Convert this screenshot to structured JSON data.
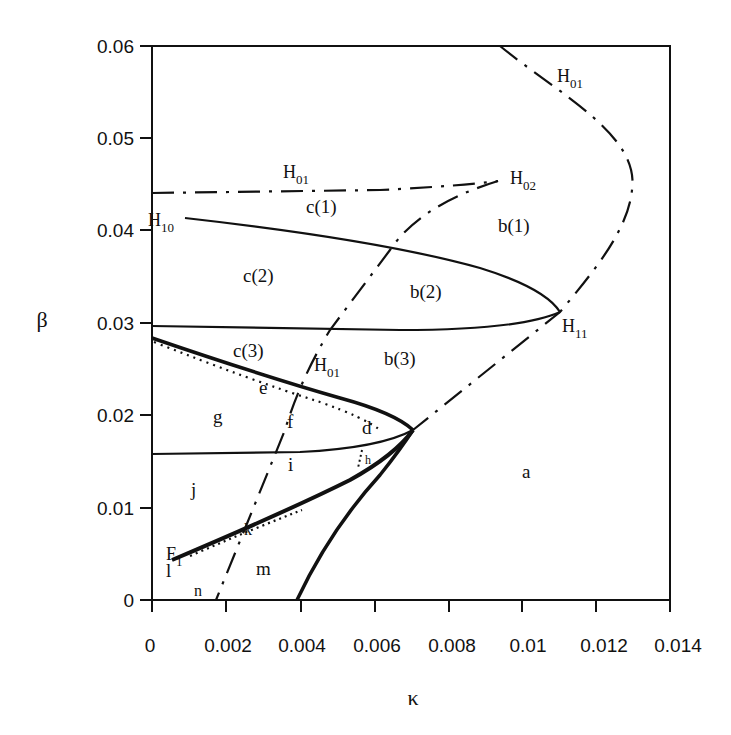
{
  "figure": {
    "x_axis": {
      "label": "κ",
      "ticks": [
        "0",
        "0.002",
        "0.004",
        "0.006",
        "0.008",
        "0.01",
        "0.012",
        "0.014"
      ],
      "range": [
        0,
        0.014
      ]
    },
    "y_axis": {
      "label": "β",
      "ticks": [
        "0",
        "0.01",
        "0.02",
        "0.03",
        "0.04",
        "0.05",
        "0.06"
      ],
      "range": [
        0,
        0.06
      ]
    },
    "curve_labels": [
      {
        "id": "H01_top_right",
        "main": "H",
        "sub": "01"
      },
      {
        "id": "H01_horizontal",
        "main": "H",
        "sub": "01"
      },
      {
        "id": "H02",
        "main": "H",
        "sub": "02"
      },
      {
        "id": "H10",
        "main": "H",
        "sub": "10"
      },
      {
        "id": "H11",
        "main": "H",
        "sub": "11"
      },
      {
        "id": "H01_middle",
        "main": "H",
        "sub": "01"
      },
      {
        "id": "F1",
        "main": "F",
        "sub": "1"
      }
    ],
    "regions": {
      "a": "a",
      "b1": "b(1)",
      "b2": "b(2)",
      "b3": "b(3)",
      "c1": "c(1)",
      "c2": "c(2)",
      "c3": "c(3)",
      "d": "d",
      "e": "e",
      "f": "f",
      "g": "g",
      "h": "h",
      "i": "i",
      "j": "j",
      "k": "k",
      "l": "l",
      "m": "m",
      "n": "n"
    },
    "legend_note": "solid = bifurcation curves, dash-dot = Hopf curves, dotted = fold curves"
  }
}
